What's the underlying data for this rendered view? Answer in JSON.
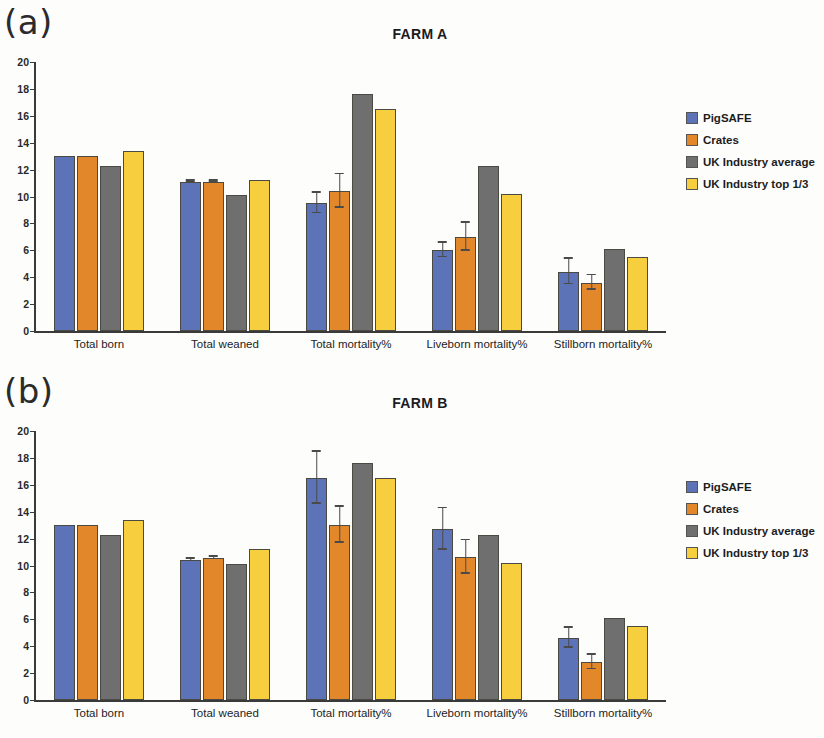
{
  "figure": {
    "panels": [
      {
        "panel_label": "(a)",
        "title": "FARM A"
      },
      {
        "panel_label": "(b)",
        "title": "FARM B"
      }
    ],
    "legend": [
      {
        "label": "PigSAFE",
        "color": "#5d73b8"
      },
      {
        "label": "Crates",
        "color": "#e2882b"
      },
      {
        "label": "UK Industry average",
        "color": "#6f6f6f"
      },
      {
        "label": "UK Industry top 1/3",
        "color": "#f6ce3e"
      }
    ]
  },
  "chart_data": [
    {
      "type": "bar",
      "title": "FARM A",
      "panel_label": "(a)",
      "xlabel": "",
      "ylabel": "",
      "ylim": [
        0,
        20
      ],
      "yticks": [
        0,
        2,
        4,
        6,
        8,
        10,
        12,
        14,
        16,
        18,
        20
      ],
      "grid": false,
      "legend_position": "right",
      "categories": [
        "Total born",
        "Total weaned",
        "Total mortality%",
        "Liveborn mortality%",
        "Stillborn mortality%"
      ],
      "series": [
        {
          "name": "PigSAFE",
          "color": "#5d73b8",
          "values": [
            13.0,
            11.1,
            9.5,
            6.0,
            4.4
          ],
          "errors": [
            0,
            0.1,
            0.8,
            0.6,
            1.0
          ]
        },
        {
          "name": "Crates",
          "color": "#e2882b",
          "values": [
            13.0,
            11.1,
            10.4,
            7.0,
            3.6
          ],
          "errors": [
            0,
            0.1,
            1.3,
            1.1,
            0.6
          ]
        },
        {
          "name": "UK Industry average",
          "color": "#6f6f6f",
          "values": [
            12.3,
            10.1,
            17.6,
            12.3,
            6.1
          ],
          "errors": [
            0,
            0,
            0,
            0,
            0
          ]
        },
        {
          "name": "UK Industry top 1/3",
          "color": "#f6ce3e",
          "values": [
            13.4,
            11.2,
            16.5,
            10.2,
            5.5
          ],
          "errors": [
            0,
            0,
            0,
            0,
            0
          ]
        }
      ]
    },
    {
      "type": "bar",
      "title": "FARM B",
      "panel_label": "(b)",
      "xlabel": "",
      "ylabel": "",
      "ylim": [
        0,
        20
      ],
      "yticks": [
        0,
        2,
        4,
        6,
        8,
        10,
        12,
        14,
        16,
        18,
        20
      ],
      "grid": false,
      "legend_position": "right",
      "categories": [
        "Total born",
        "Total weaned",
        "Total mortality%",
        "Liveborn mortality%",
        "Stillborn mortality%"
      ],
      "series": [
        {
          "name": "PigSAFE",
          "color": "#5d73b8",
          "values": [
            13.0,
            10.4,
            16.5,
            12.7,
            4.6
          ],
          "errors": [
            0,
            0.15,
            2.0,
            1.6,
            0.8
          ]
        },
        {
          "name": "Crates",
          "color": "#e2882b",
          "values": [
            13.0,
            10.55,
            13.0,
            10.6,
            2.8
          ],
          "errors": [
            0,
            0.15,
            1.4,
            1.3,
            0.6
          ]
        },
        {
          "name": "UK Industry average",
          "color": "#6f6f6f",
          "values": [
            12.3,
            10.1,
            17.6,
            12.3,
            6.1
          ],
          "errors": [
            0,
            0,
            0,
            0,
            0
          ]
        },
        {
          "name": "UK Industry top 1/3",
          "color": "#f6ce3e",
          "values": [
            13.4,
            11.2,
            16.5,
            10.2,
            5.5
          ],
          "errors": [
            0,
            0,
            0,
            0,
            0
          ]
        }
      ]
    }
  ]
}
